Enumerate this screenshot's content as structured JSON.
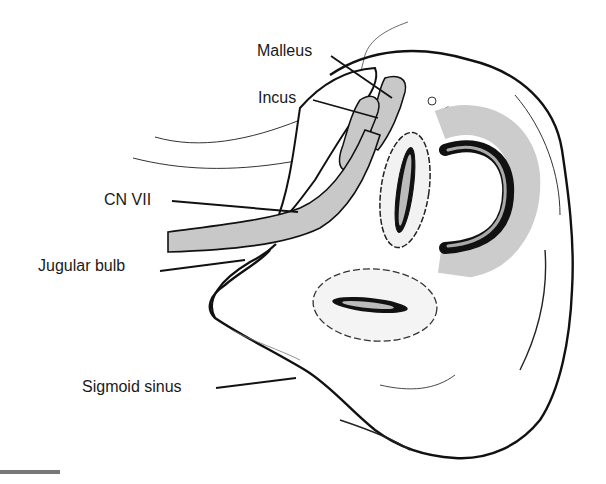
{
  "figure": {
    "type": "anatomical line drawing",
    "colors": {
      "ink": "#111111",
      "shading": "#c8c8c8",
      "scale_bar": "#777777"
    }
  },
  "labels": {
    "malleus": "Malleus",
    "incus": "Incus",
    "cn7": "CN VII",
    "jugular_bulb": "Jugular bulb",
    "sigmoid_sinus": "Sigmoid sinus"
  }
}
